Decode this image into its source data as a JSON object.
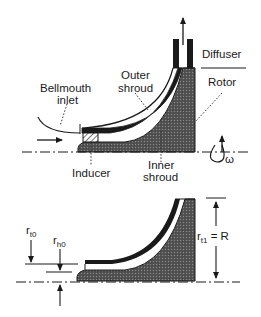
{
  "figure": {
    "top_view": {
      "labels": {
        "diffuser": "Diffuser",
        "rotor": "Rotor",
        "outer_shroud_line1": "Outer",
        "outer_shroud_line2": "shroud",
        "bellmouth_line1": "Bellmouth",
        "bellmouth_line2": "inlet",
        "inducer": "Inducer",
        "inner_shroud_line1": "Inner",
        "inner_shroud_line2": "shroud",
        "omega": "ω"
      }
    },
    "bottom_view": {
      "labels": {
        "r_t0_main": "r",
        "r_t0_sub": "t0",
        "r_h0_main": "r",
        "r_h0_sub": "h0",
        "r_t1_main": "r",
        "r_t1_sub": "t1",
        "r_t1_eq": " = R"
      }
    },
    "colors": {
      "ink": "#1a1a1a",
      "rotor_fill": "#4a4a4a",
      "shroud_fill": "#2a2a2a",
      "background": "#ffffff"
    }
  }
}
